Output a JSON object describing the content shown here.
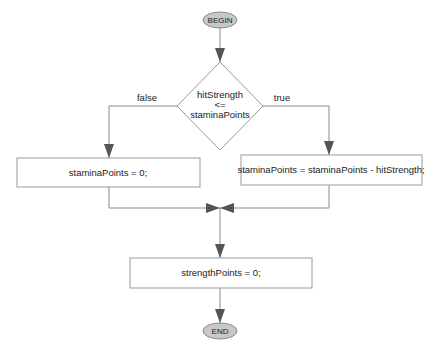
{
  "diagram": {
    "type": "flowchart",
    "colors": {
      "line": "#8a8a8a",
      "arrow": "#555555",
      "terminal_fill": "#c8c8c8",
      "box_stroke": "#9a9a9a"
    },
    "begin": {
      "label": "BEGIN"
    },
    "decision": {
      "line1": "hitStrength",
      "line2": "<=",
      "line3": "staminaPoints",
      "false_label": "false",
      "true_label": "true"
    },
    "false_branch": {
      "statement": "staminaPoints = 0;"
    },
    "true_branch": {
      "statement": "staminaPoints = staminaPoints - hitStrength;"
    },
    "after_merge": {
      "statement": "strengthPoints = 0;"
    },
    "end": {
      "label": "END"
    }
  }
}
